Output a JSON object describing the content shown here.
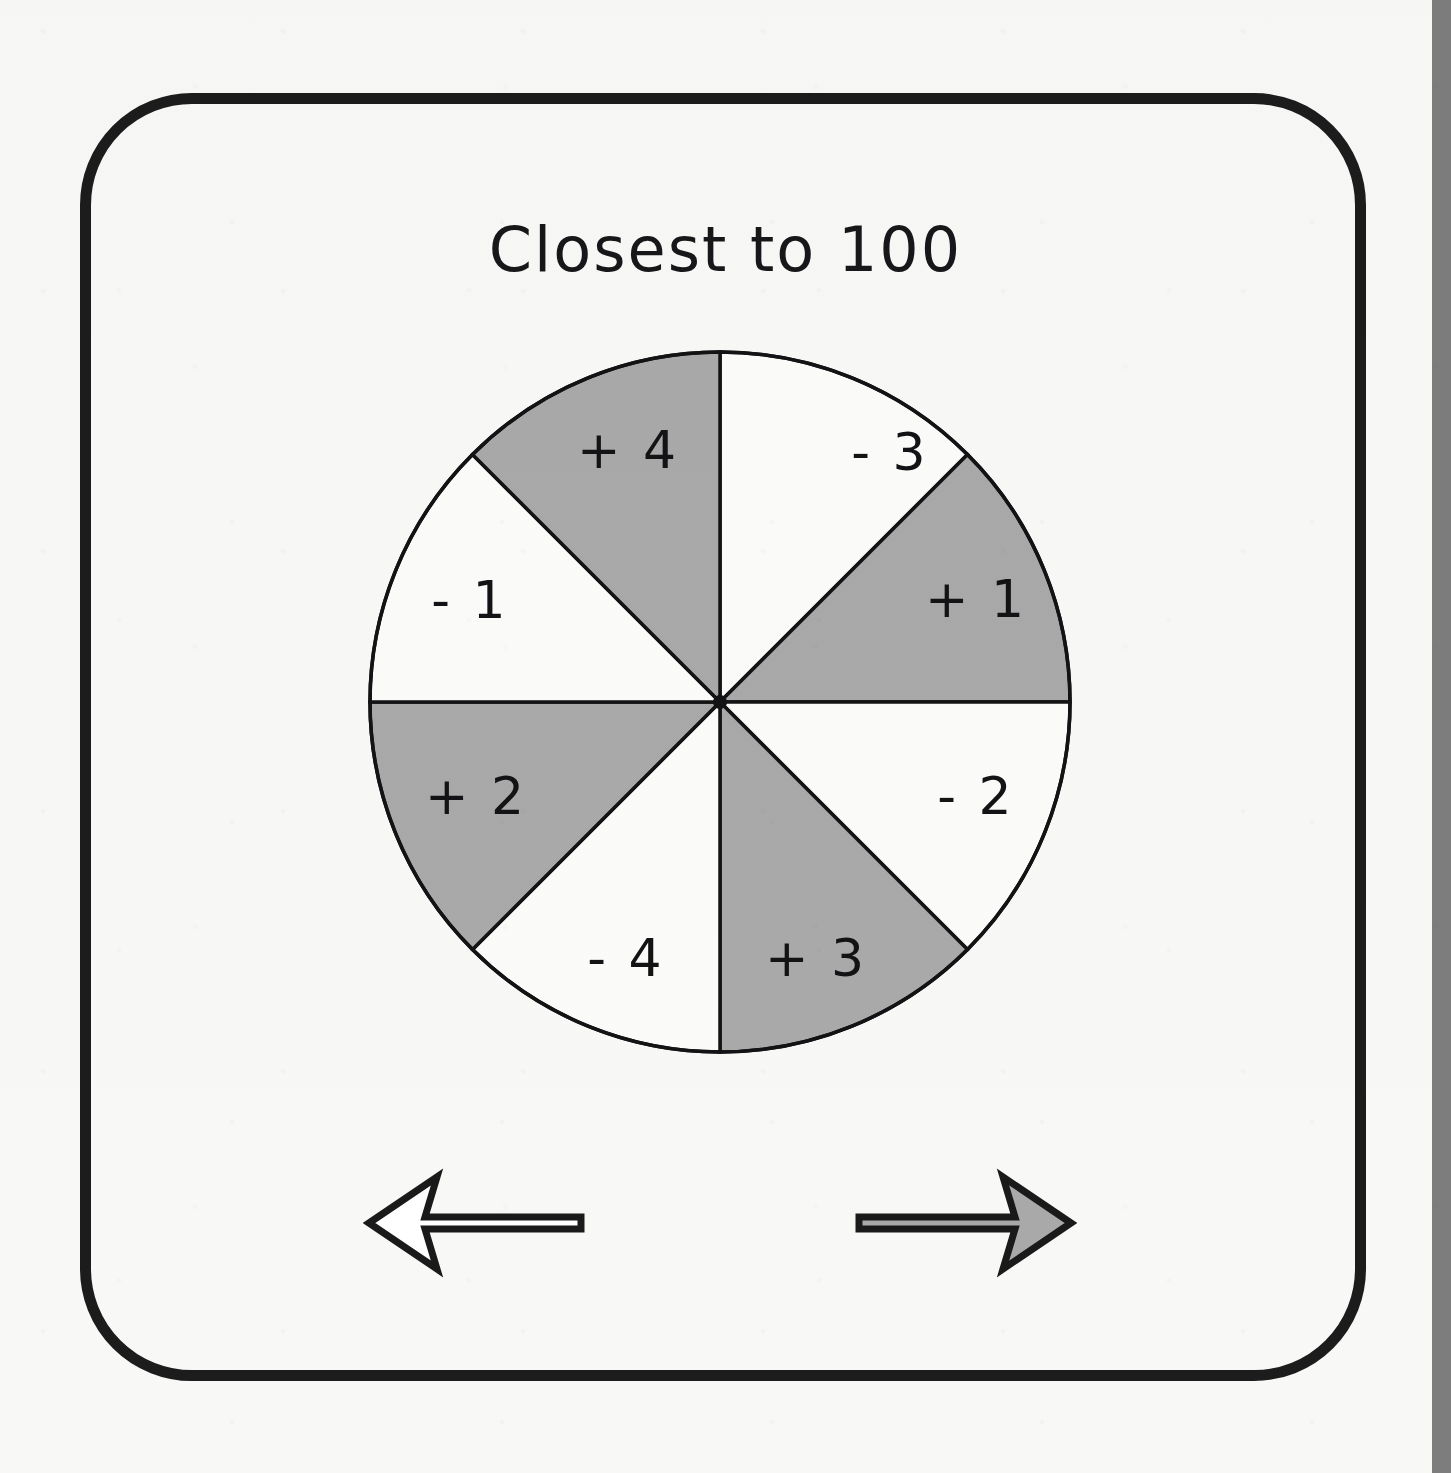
{
  "page": {
    "background_color": "#f8f8f6",
    "edge_strip_color": "#7d7d7d"
  },
  "card": {
    "border_color": "#1c1c1c",
    "corner_radius_px": 112
  },
  "title": {
    "text": "Closest to 100"
  },
  "spinner": {
    "name": "closest-to-100-spinner",
    "outline_color": "#131315",
    "shaded_color": "#a9a9a9",
    "unshaded_color": "#fbfbf9",
    "segment_count": 8,
    "segments": [
      {
        "label": "- 3",
        "value": -3,
        "shaded": false,
        "start_deg": 0,
        "end_deg": 45,
        "label_x": 522,
        "label_y": 106
      },
      {
        "label": "+ 1",
        "value": 1,
        "shaded": true,
        "start_deg": 45,
        "end_deg": 90,
        "label_x": 608,
        "label_y": 253
      },
      {
        "label": "- 2",
        "value": -2,
        "shaded": false,
        "start_deg": 90,
        "end_deg": 135,
        "label_x": 608,
        "label_y": 450
      },
      {
        "label": "+ 3",
        "value": 3,
        "shaded": true,
        "start_deg": 135,
        "end_deg": 180,
        "label_x": 448,
        "label_y": 612
      },
      {
        "label": "- 4",
        "value": -4,
        "shaded": false,
        "start_deg": 180,
        "end_deg": 225,
        "label_x": 258,
        "label_y": 612
      },
      {
        "label": "+ 2",
        "value": 2,
        "shaded": true,
        "start_deg": 225,
        "end_deg": 270,
        "label_x": 108,
        "label_y": 450
      },
      {
        "label": "- 1",
        "value": -1,
        "shaded": false,
        "start_deg": 270,
        "end_deg": 315,
        "label_x": 102,
        "label_y": 254
      },
      {
        "label": "+ 4",
        "value": 4,
        "shaded": true,
        "start_deg": 315,
        "end_deg": 360,
        "label_x": 260,
        "label_y": 104
      }
    ]
  },
  "controls": {
    "previous": {
      "icon": "arrow-left-icon",
      "fill": "#ffffff",
      "stroke": "#1a1a1a"
    },
    "next": {
      "icon": "arrow-right-icon",
      "fill": "#a9a9a9",
      "stroke": "#1a1a1a"
    }
  }
}
